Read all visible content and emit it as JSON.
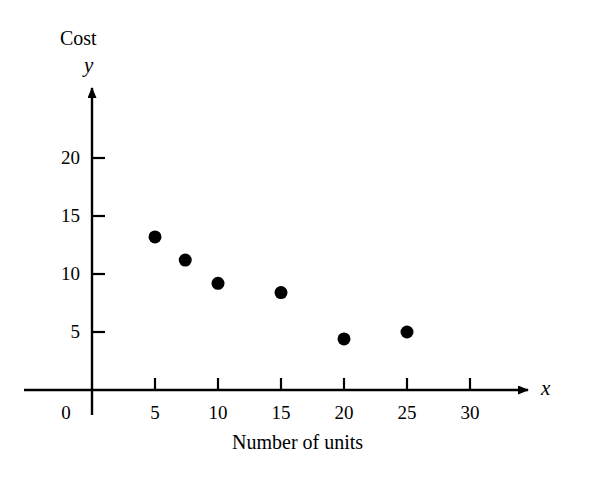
{
  "chart_data": {
    "type": "scatter",
    "title": "",
    "xlabel": "Number of units",
    "ylabel": "Cost",
    "x_axis_variable": "x",
    "y_axis_variable": "y",
    "xlim": [
      0,
      33
    ],
    "ylim": [
      0,
      23
    ],
    "grid": false,
    "legend": null,
    "x_ticks": [
      {
        "value": 5,
        "label": "5"
      },
      {
        "value": 10,
        "label": "10"
      },
      {
        "value": 15,
        "label": "15"
      },
      {
        "value": 20,
        "label": "20"
      },
      {
        "value": 25,
        "label": "25"
      },
      {
        "value": 30,
        "label": "30"
      }
    ],
    "y_ticks": [
      {
        "value": 5,
        "label": "5"
      },
      {
        "value": 10,
        "label": "10"
      },
      {
        "value": 15,
        "label": "15"
      },
      {
        "value": 20,
        "label": "20"
      }
    ],
    "origin_label": "0",
    "points": [
      {
        "x": 5,
        "y": 13.2
      },
      {
        "x": 7.4,
        "y": 11.2
      },
      {
        "x": 10,
        "y": 9.2
      },
      {
        "x": 15,
        "y": 8.4
      },
      {
        "x": 20,
        "y": 4.4
      },
      {
        "x": 25,
        "y": 5.0
      }
    ],
    "marker": {
      "shape": "circle",
      "color": "#000000",
      "radius": 6.5
    },
    "axis_color": "#000000",
    "background_color": "#ffffff"
  }
}
